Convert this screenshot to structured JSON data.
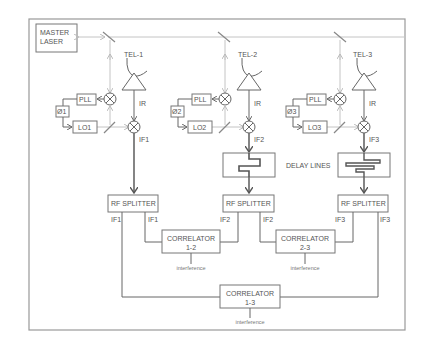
{
  "diagram": {
    "master_laser": {
      "line1": "MASTER",
      "line2": "LASER"
    },
    "delay_lines_label": "DELAY LINES",
    "telescopes": [
      {
        "name": "TEL-1",
        "ir_label": "IR",
        "if_label": "IF1",
        "pll": "PLL",
        "phase": "Ø1",
        "lo": "LO1"
      },
      {
        "name": "TEL-2",
        "ir_label": "IR",
        "if_label": "IF2",
        "pll": "PLL",
        "phase": "Ø2",
        "lo": "LO2"
      },
      {
        "name": "TEL-3",
        "ir_label": "IR",
        "if_label": "IF3",
        "pll": "PLL",
        "phase": "Ø3",
        "lo": "LO3"
      }
    ],
    "splitters": [
      {
        "label": "RF SPLITTER",
        "out_left": "IF1",
        "out_right": "IF1"
      },
      {
        "label": "RF SPLITTER",
        "out_left": "IF2",
        "out_right": "IF2"
      },
      {
        "label": "RF SPLITTER",
        "out_left": "IF3",
        "out_right": "IF3"
      }
    ],
    "correlators": [
      {
        "title": "CORRELATOR",
        "pair": "1-2",
        "output": "interference"
      },
      {
        "title": "CORRELATOR",
        "pair": "2-3",
        "output": "interference"
      },
      {
        "title": "CORRELATOR",
        "pair": "1-3",
        "output": "interference"
      }
    ]
  }
}
